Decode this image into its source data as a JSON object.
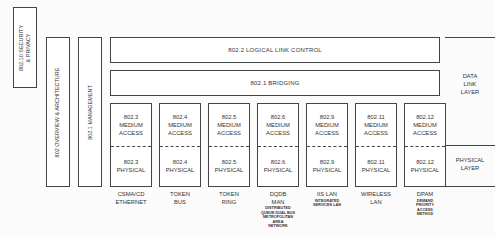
{
  "side_boxes": {
    "security": {
      "line1": "802.10 SECURITY",
      "line2": "& PRIVACY"
    },
    "overview": {
      "label": "802 OVERVIEW & ARCHITECTURE"
    },
    "management": {
      "label": "802.1 MANAGEMENT"
    }
  },
  "bars": {
    "llc": "802.2 LOGICAL LINK CONTROL",
    "bridging": "802.1 BRIDGING"
  },
  "columns": [
    {
      "mac_num": "802.3",
      "mac_l1": "MEDIUM",
      "mac_l2": "ACCESS",
      "phy_num": "802.3",
      "phy_label": "PHYSICAL",
      "name_l1": "CSMA/CD",
      "name_l2": "ETHERNET",
      "sub": []
    },
    {
      "mac_num": "802.4",
      "mac_l1": "MEDIUM",
      "mac_l2": "ACCESS",
      "phy_num": "802.4",
      "phy_label": "PHYSICAL",
      "name_l1": "TOKEN",
      "name_l2": "BUS",
      "sub": []
    },
    {
      "mac_num": "802.5",
      "mac_l1": "MEDIUM",
      "mac_l2": "ACCESS",
      "phy_num": "802.5",
      "phy_label": "PHYSICAL",
      "name_l1": "TOKEN",
      "name_l2": "RING",
      "sub": []
    },
    {
      "mac_num": "802.6",
      "mac_l1": "MEDIUM",
      "mac_l2": "ACCESS",
      "phy_num": "802.6",
      "phy_label": "PHYSICAL",
      "name_l1": "DQDB",
      "name_l2": "MAN",
      "sub": [
        "DISTRIBUTED",
        "QUEUE DUAL BUS",
        "METROPOLITAN",
        "AREA",
        "NETWORK"
      ]
    },
    {
      "mac_num": "802.9",
      "mac_l1": "MEDIUM",
      "mac_l2": "ACCESS",
      "phy_num": "802.9",
      "phy_label": "PHYSICAL",
      "name_l1": "IIS LAN",
      "name_l2": "",
      "sub": [
        "INTEGRATED",
        "SERVICES LAN"
      ]
    },
    {
      "mac_num": "802.11",
      "mac_l1": "MEDIUM",
      "mac_l2": "ACCESS",
      "phy_num": "802.11",
      "phy_label": "PHYSICAL",
      "name_l1": "WIRELESS",
      "name_l2": "LAN",
      "sub": []
    },
    {
      "mac_num": "802.12",
      "mac_l1": "MEDIUM",
      "mac_l2": "ACCESS",
      "phy_num": "802.12",
      "phy_label": "PHYSICAL",
      "name_l1": "DPAM",
      "name_l2": "",
      "sub": [
        "DEMAND",
        "PRIORITY",
        "ACCESS",
        "METHOD"
      ]
    }
  ],
  "layers": {
    "data_link": {
      "l1": "DATA",
      "l2": "LINK",
      "l3": "LAYER"
    },
    "physical": {
      "l1": "PHYSICAL",
      "l2": "LAYER"
    }
  }
}
